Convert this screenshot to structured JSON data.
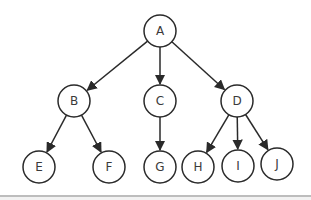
{
  "diagram": {
    "type": "tree",
    "nodes": [
      {
        "id": "A",
        "label": "A",
        "x": 160,
        "y": 31
      },
      {
        "id": "B",
        "label": "B",
        "x": 74,
        "y": 101
      },
      {
        "id": "C",
        "label": "C",
        "x": 160,
        "y": 101
      },
      {
        "id": "D",
        "label": "D",
        "x": 237,
        "y": 101
      },
      {
        "id": "E",
        "label": "E",
        "x": 39,
        "y": 167
      },
      {
        "id": "F",
        "label": "F",
        "x": 109,
        "y": 167
      },
      {
        "id": "G",
        "label": "G",
        "x": 160,
        "y": 167
      },
      {
        "id": "H",
        "label": "H",
        "x": 198,
        "y": 167
      },
      {
        "id": "I",
        "label": "I",
        "x": 238,
        "y": 166
      },
      {
        "id": "J",
        "label": "J",
        "x": 277,
        "y": 164
      }
    ],
    "edges": [
      {
        "from": "A",
        "to": "B"
      },
      {
        "from": "A",
        "to": "C"
      },
      {
        "from": "A",
        "to": "D"
      },
      {
        "from": "B",
        "to": "E"
      },
      {
        "from": "B",
        "to": "F"
      },
      {
        "from": "C",
        "to": "G"
      },
      {
        "from": "D",
        "to": "H"
      },
      {
        "from": "D",
        "to": "I"
      },
      {
        "from": "D",
        "to": "J"
      }
    ],
    "node_radius": 16,
    "colors": {
      "stroke": "#2a2a2a",
      "text": "#3a3a3a",
      "divider": "#bdbdbd"
    }
  }
}
